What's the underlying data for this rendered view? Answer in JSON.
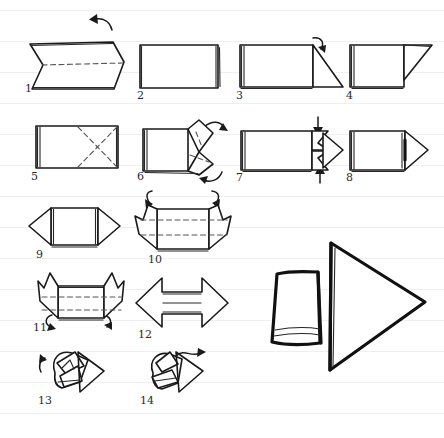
{
  "page": {
    "width": 444,
    "height": 438,
    "background_color": "#ffffff",
    "ink_color": "#1a1a1a",
    "rule_line_color": "#efefef",
    "rule_line_spacing": 31,
    "rule_line_first_y": 10,
    "media": "hand-drawn pen on ruled notebook paper"
  },
  "diagram": {
    "total_steps": 14,
    "fold_line_style": "dashed",
    "motion_arrow_style": "curved hand-drawn",
    "steps": [
      {
        "number": "1",
        "label": "1",
        "shape": "chevron-band-with-center-fold",
        "fold_lines": [
          "horizontal-center-dashed"
        ],
        "motion_arrows": [
          "curve-up-left"
        ]
      },
      {
        "number": "2",
        "label": "2",
        "shape": "folded-rectangle",
        "fold_lines": [],
        "motion_arrows": []
      },
      {
        "number": "3",
        "label": "3",
        "shape": "rectangle-with-right-triangle-flap",
        "fold_lines": [],
        "motion_arrows": [
          "curve-down-right"
        ]
      },
      {
        "number": "4",
        "label": "4",
        "shape": "rectangle-with-folded-corner",
        "fold_lines": [],
        "motion_arrows": []
      },
      {
        "number": "5",
        "label": "5",
        "shape": "rectangle-with-x-creases",
        "fold_lines": [
          "diagonal-x-dashed-right-half"
        ],
        "motion_arrows": []
      },
      {
        "number": "6",
        "label": "6",
        "shape": "rectangle-with-open-right-flap",
        "fold_lines": [
          "diagonal-dashed-on-flap"
        ],
        "motion_arrows": [
          "curve-up-right",
          "curve-down-right"
        ]
      },
      {
        "number": "7",
        "label": "7",
        "shape": "rectangle-with-inverted-point",
        "fold_lines": [],
        "motion_arrows": [
          "straight-down",
          "straight-up"
        ]
      },
      {
        "number": "8",
        "label": "8",
        "shape": "rectangle-with-arrow-point",
        "fold_lines": [],
        "motion_arrows": []
      },
      {
        "number": "9",
        "label": "9",
        "shape": "double-pointed-band",
        "fold_lines": [],
        "motion_arrows": []
      },
      {
        "number": "10",
        "label": "10",
        "shape": "double-pointed-band-with-horizontal-creases",
        "fold_lines": [
          "horizontal-dashed-upper",
          "horizontal-dashed-lower"
        ],
        "motion_arrows": [
          "curve-up-left",
          "curve-up-right"
        ]
      },
      {
        "number": "11",
        "label": "11",
        "shape": "band-with-raised-side-flaps",
        "fold_lines": [
          "horizontal-dashed-upper",
          "horizontal-dashed-lower"
        ],
        "motion_arrows": [
          "curve-down-left",
          "curve-down-right"
        ]
      },
      {
        "number": "12",
        "label": "12",
        "shape": "double-headed-arrow-flat",
        "fold_lines": [],
        "motion_arrows": []
      },
      {
        "number": "13",
        "label": "13",
        "shape": "arrow-three-quarter-view-folding",
        "fold_lines": [],
        "motion_arrows": [
          "curve-up-left-small"
        ]
      },
      {
        "number": "14",
        "label": "14",
        "shape": "arrow-three-quarter-view-nearly-done",
        "fold_lines": [],
        "motion_arrows": [
          "wavy-right"
        ]
      }
    ],
    "final_model": {
      "name": "finished-3d-arrow",
      "description": "large completed three-dimensional arrow pointing right",
      "position": "bottom-right"
    }
  }
}
